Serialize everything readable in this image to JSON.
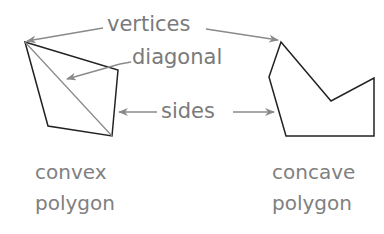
{
  "labels": {
    "vertices": "vertices",
    "diagonal": "diagonal",
    "sides": "sides"
  },
  "captions": {
    "convex": {
      "line1": "convex",
      "line2": "polygon"
    },
    "concave": {
      "line1": "concave",
      "line2": "polygon"
    }
  },
  "shapes": {
    "convex_polygon": [
      [
        25,
        42
      ],
      [
        118,
        70
      ],
      [
        112,
        136
      ],
      [
        48,
        126
      ]
    ],
    "convex_diagonal": [
      [
        25,
        42
      ],
      [
        112,
        136
      ]
    ],
    "concave_polygon": [
      [
        281,
        42
      ],
      [
        269,
        77
      ],
      [
        286,
        136
      ],
      [
        374,
        136
      ],
      [
        374,
        78
      ],
      [
        331,
        101
      ]
    ]
  },
  "colors": {
    "polygon_stroke": "#222222",
    "label_text": "#7a7a7a",
    "arrow": "#8a8a8a"
  }
}
